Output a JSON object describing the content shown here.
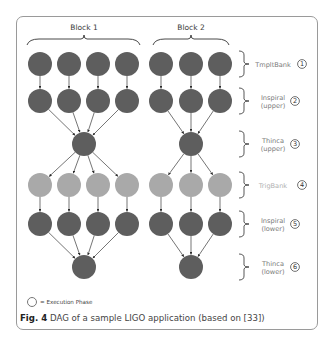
{
  "diagram": {
    "blocks": [
      {
        "label": "Block 1",
        "label_x": 84,
        "brace_x1": 27,
        "brace_x2": 140,
        "columns_x": [
          40,
          69,
          98,
          127
        ],
        "center_x": 84
      },
      {
        "label": "Block 2",
        "label_x": 191,
        "brace_x1": 153,
        "brace_x2": 229,
        "columns_x": [
          161,
          191,
          220
        ],
        "center_x": 191
      }
    ],
    "phases": [
      {
        "id": 1,
        "name": "TmpltBank",
        "line1": "TmpltBank",
        "line2": "",
        "y": 64,
        "type": "row",
        "light": false
      },
      {
        "id": 2,
        "name": "Inspiral (upper)",
        "line1": "Inspiral",
        "line2": "(upper)",
        "y": 101,
        "type": "row",
        "light": false
      },
      {
        "id": 3,
        "name": "Thinca (upper)",
        "line1": "Thinca",
        "line2": "(upper)",
        "y": 144,
        "type": "merge",
        "light": false
      },
      {
        "id": 4,
        "name": "TrigBank",
        "line1": "TrigBank",
        "line2": "",
        "y": 185,
        "type": "row",
        "light": true
      },
      {
        "id": 5,
        "name": "Inspiral (lower)",
        "line1": "Inspiral",
        "line2": "(lower)",
        "y": 224,
        "type": "row",
        "light": false
      },
      {
        "id": 6,
        "name": "Thinca (lower)",
        "line1": "Thinca",
        "line2": "(lower)",
        "y": 267,
        "type": "merge",
        "light": false
      }
    ],
    "node_radius": 12,
    "colors": {
      "dark_node": "#5e5e5e",
      "light_node": "#a9a9a9",
      "edge": "#3a3a3a",
      "bracket": "#444444"
    }
  },
  "legend": {
    "text": "= Execution Phase"
  },
  "caption": {
    "label": "Fig. 4",
    "text": " DAG of a sample LIGO application (based on [33])"
  }
}
